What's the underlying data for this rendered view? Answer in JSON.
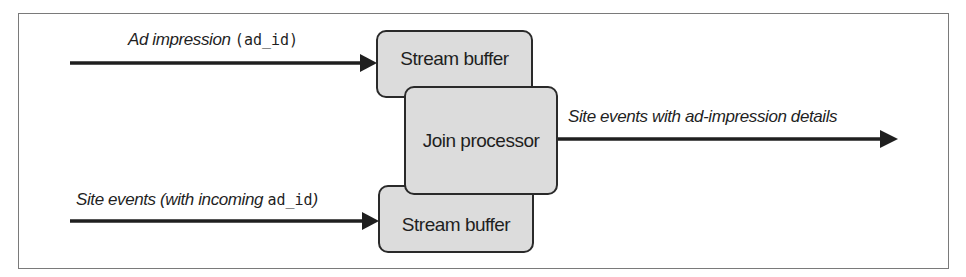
{
  "diagram": {
    "nodes": {
      "stream_buffer_top": {
        "label": "Stream buffer"
      },
      "join_processor": {
        "label": "Join processor"
      },
      "stream_buffer_bottom": {
        "label": "Stream buffer"
      }
    },
    "edges": {
      "ad_impression": {
        "label_text": "Ad impression",
        "label_open": "(",
        "label_code": "ad_id",
        "label_close": ")",
        "from": "external",
        "to": "stream_buffer_top"
      },
      "site_events": {
        "label_text": "Site events (with incoming ",
        "label_code": "ad_id",
        "label_close": ")",
        "from": "external",
        "to": "stream_buffer_bottom"
      },
      "output": {
        "label_text": "Site events with ad-impression details",
        "from": "join_processor",
        "to": "external"
      }
    },
    "colors": {
      "box_fill": "#dcdcdc",
      "stroke": "#1f1f1f",
      "frame": "#7a7a7a"
    }
  }
}
